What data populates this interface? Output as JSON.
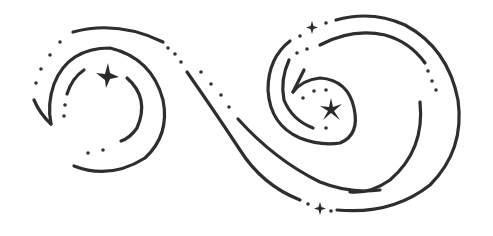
{
  "illustration": {
    "title": "",
    "description": "Decorative swirl line art with dots and sparkle stars",
    "colors": {
      "ink": "#2e2e2e",
      "background": "#ffffff"
    },
    "elements": {
      "left_spiral": {
        "label": ""
      },
      "right_spiral": {
        "label": ""
      },
      "stars": [
        {
          "name": "left-spiral-star",
          "x": 106,
          "y": 76,
          "size": 11
        },
        {
          "name": "right-spiral-star",
          "x": 331,
          "y": 110,
          "size": 10
        },
        {
          "name": "top-small-star",
          "x": 312,
          "y": 27,
          "size": 5
        },
        {
          "name": "bottom-small-star",
          "x": 320,
          "y": 208,
          "size": 5
        }
      ]
    }
  }
}
